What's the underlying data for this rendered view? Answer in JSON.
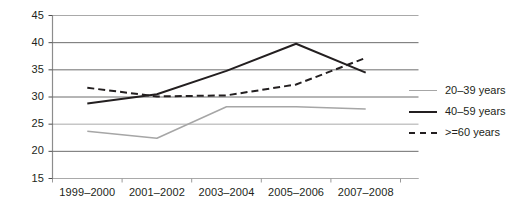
{
  "chart_data": {
    "type": "line",
    "title": "",
    "subtitle": "",
    "xlabel": "",
    "ylabel": "",
    "categories": [
      "1999–2000",
      "2001–2002",
      "2003–2004",
      "2005–2006",
      "2007–2008"
    ],
    "ylim": [
      15,
      45
    ],
    "yticks": [
      15,
      20,
      25,
      30,
      35,
      40,
      45
    ],
    "ytick_labels": [
      "15",
      "20",
      "25",
      "30",
      "35",
      "40",
      "45"
    ],
    "grid": true,
    "grid_axis": "y",
    "legend_position": "right",
    "series": [
      {
        "name": "20–39 years",
        "values": [
          23.7,
          22.4,
          28.2,
          28.2,
          27.8
        ],
        "color": "#a6a6a6",
        "style": "solid"
      },
      {
        "name": "40–59 years",
        "values": [
          28.8,
          30.5,
          34.8,
          39.8,
          34.5
        ],
        "color": "#231f20",
        "style": "solid"
      },
      {
        "name": ">=60 years",
        "values": [
          31.7,
          30.1,
          30.3,
          32.3,
          37.2
        ],
        "color": "#231f20",
        "style": "dashed"
      }
    ]
  },
  "legend": {
    "items": [
      {
        "label": "20–39 years",
        "swatch": "line-solid-gray-icon"
      },
      {
        "label": "40–59 years",
        "swatch": "line-solid-black-icon"
      },
      {
        "label": ">=60 years",
        "swatch": "line-dashed-black-icon"
      }
    ]
  }
}
